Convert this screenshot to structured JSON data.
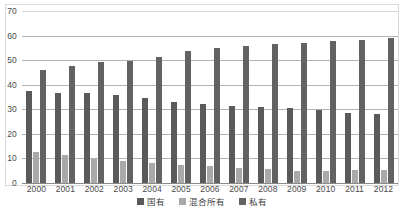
{
  "chart_data": {
    "type": "bar",
    "title": "",
    "subtitle": "",
    "xlabel": "",
    "ylabel": "",
    "ylim": [
      0,
      70
    ],
    "ytick_step": 10,
    "yticks": [
      70,
      60,
      50,
      40,
      30,
      20,
      10,
      0
    ],
    "grid": true,
    "legend_position": "bottom-center",
    "categories": [
      "2000",
      "2001",
      "2002",
      "2003",
      "2004",
      "2005",
      "2006",
      "2007",
      "2008",
      "2009",
      "2010",
      "2011",
      "2012"
    ],
    "series": [
      {
        "name": "国有",
        "color": "#5a5a5a",
        "values": [
          37.5,
          36.8,
          36.5,
          35.8,
          34.8,
          33.0,
          32.2,
          31.5,
          30.8,
          30.6,
          29.6,
          28.6,
          28.0
        ]
      },
      {
        "name": "混合所有",
        "color": "#a9a9a9",
        "values": [
          12.5,
          11.2,
          9.8,
          8.9,
          8.2,
          7.4,
          6.8,
          6.1,
          5.6,
          4.9,
          4.9,
          5.4,
          5.1
        ]
      },
      {
        "name": "私有",
        "color": "#626262",
        "values": [
          46.0,
          47.5,
          49.4,
          49.8,
          51.3,
          53.6,
          54.8,
          55.7,
          56.5,
          57.1,
          58.0,
          58.2,
          59.2
        ]
      }
    ]
  },
  "legend": {
    "items": [
      {
        "label": "国有",
        "swatch_class": "s-state"
      },
      {
        "label": "混合所有",
        "swatch_class": "s-mixed"
      },
      {
        "label": "私有",
        "swatch_class": "s-private"
      }
    ]
  }
}
